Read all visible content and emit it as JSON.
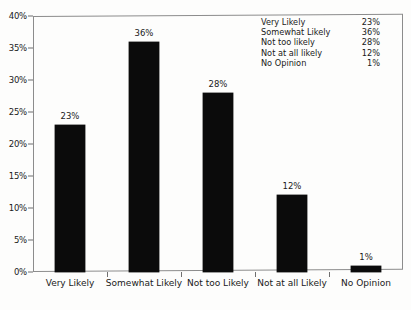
{
  "chart_data": {
    "type": "bar",
    "title": "",
    "subtitle": "",
    "xlabel": "",
    "ylabel": "",
    "categories": [
      "Very Likely",
      "Somewhat Likely",
      "Not too Likely",
      "Not at all Likely",
      "No Opinion"
    ],
    "values": [
      23,
      36,
      28,
      12,
      1
    ],
    "value_labels": [
      "23%",
      "36%",
      "28%",
      "12%",
      "1%"
    ],
    "ylim": [
      0,
      40
    ],
    "y_ticks": [
      0,
      5,
      10,
      15,
      20,
      25,
      30,
      35,
      40
    ],
    "y_tick_labels": [
      "0%",
      "5%",
      "10%",
      "15%",
      "20%",
      "25%",
      "30%",
      "35%",
      "40%"
    ],
    "grid": false,
    "legend_position": "top-right",
    "bar_color": "#0b0b0b",
    "axis_color": "#8c8c8c",
    "text_color": "#1a1a1a",
    "background_color": "#fdfdfc"
  },
  "legend": {
    "rows": [
      {
        "label": "Very Likely",
        "value": "23%"
      },
      {
        "label": "Somewhat Likely",
        "value": "36%"
      },
      {
        "label": "Not too likely",
        "value": "28%"
      },
      {
        "label": "Not at all likely",
        "value": "12%"
      },
      {
        "label": "No Opinion",
        "value": "1%"
      }
    ]
  }
}
